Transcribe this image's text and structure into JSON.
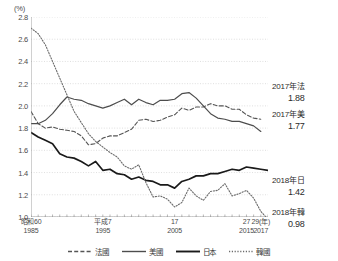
{
  "chart_data": {
    "type": "line",
    "title": "",
    "xlabel": "(年)",
    "ylabel": "(%)",
    "unit_label": "(%)",
    "ylim": [
      1.0,
      2.8
    ],
    "ytick_values": [
      "1.0",
      "1.2",
      "1.4",
      "1.6",
      "1.8",
      "2.0",
      "2.2",
      "2.4",
      "2.6",
      "2.8"
    ],
    "xlim": [
      1985,
      2018
    ],
    "grid": true,
    "legend_position": "bottom",
    "xticks": [
      {
        "era": "昭和60",
        "west": "1985",
        "year": 1985
      },
      {
        "era": "平成7",
        "west": "1995",
        "year": 1995
      },
      {
        "era": "17",
        "west": "2005",
        "year": 2005
      },
      {
        "era": "27",
        "west": "2015",
        "year": 2015
      },
      {
        "era": "29(年)",
        "west": "2017",
        "year": 2017
      }
    ],
    "x": [
      1985,
      1986,
      1987,
      1988,
      1989,
      1990,
      1991,
      1992,
      1993,
      1994,
      1995,
      1996,
      1997,
      1998,
      1999,
      2000,
      2001,
      2002,
      2003,
      2004,
      2005,
      2006,
      2007,
      2008,
      2009,
      2010,
      2011,
      2012,
      2013,
      2014,
      2015,
      2016,
      2017,
      2018
    ],
    "series": [
      {
        "name": "法國",
        "style": "dashed",
        "color": "#555555",
        "values": [
          1.95,
          1.84,
          1.8,
          1.81,
          1.79,
          1.78,
          1.77,
          1.73,
          1.65,
          1.66,
          1.71,
          1.73,
          1.73,
          1.76,
          1.79,
          1.87,
          1.88,
          1.86,
          1.87,
          1.9,
          1.92,
          1.98,
          1.96,
          1.99,
          1.99,
          2.02,
          2.0,
          2.0,
          1.97,
          1.97,
          1.92,
          1.89,
          1.88,
          null
        ]
      },
      {
        "name": "美國",
        "style": "solid",
        "color": "#4d4d4d",
        "values": [
          1.84,
          1.84,
          1.87,
          1.93,
          2.01,
          2.08,
          2.06,
          2.05,
          2.02,
          2.0,
          1.98,
          2.0,
          2.03,
          2.06,
          2.01,
          2.06,
          2.03,
          2.01,
          2.05,
          2.05,
          2.06,
          2.11,
          2.12,
          2.07,
          2.0,
          1.93,
          1.89,
          1.88,
          1.86,
          1.86,
          1.84,
          1.82,
          1.77,
          null
        ]
      },
      {
        "name": "日本",
        "style": "solid-bold",
        "color": "#1a1a1a",
        "values": [
          1.76,
          1.72,
          1.69,
          1.66,
          1.57,
          1.54,
          1.53,
          1.5,
          1.46,
          1.5,
          1.42,
          1.43,
          1.39,
          1.38,
          1.34,
          1.36,
          1.33,
          1.32,
          1.29,
          1.29,
          1.26,
          1.32,
          1.34,
          1.37,
          1.37,
          1.39,
          1.39,
          1.41,
          1.43,
          1.42,
          1.45,
          1.44,
          1.43,
          1.42
        ]
      },
      {
        "name": "韓國",
        "style": "dotted",
        "color": "#6b6b6b",
        "values": [
          2.7,
          2.65,
          2.55,
          2.4,
          2.25,
          2.1,
          1.95,
          1.85,
          1.75,
          1.68,
          1.63,
          1.58,
          1.54,
          1.46,
          1.43,
          1.47,
          1.31,
          1.18,
          1.19,
          1.16,
          1.09,
          1.13,
          1.26,
          1.19,
          1.15,
          1.23,
          1.24,
          1.3,
          1.19,
          1.21,
          1.24,
          1.17,
          1.05,
          0.98
        ]
      }
    ],
    "annotations": [
      {
        "name": "france-2017",
        "label": "2017年法",
        "value": "1.88",
        "x": 272,
        "y": 82
      },
      {
        "name": "usa-2017",
        "label": "2017年美",
        "value": "1.77",
        "x": 272,
        "y": 110
      },
      {
        "name": "japan-2018",
        "label": "2018年日",
        "value": "1.42",
        "x": 272,
        "y": 176
      },
      {
        "name": "korea-2018",
        "label": "2018年韓",
        "value": "0.98",
        "x": 272,
        "y": 208
      }
    ],
    "legend": [
      {
        "name": "法國",
        "style": "dashed"
      },
      {
        "name": "美國",
        "style": "solid"
      },
      {
        "name": "日本",
        "style": "solid-bold"
      },
      {
        "name": "韓國",
        "style": "dotted"
      }
    ]
  }
}
